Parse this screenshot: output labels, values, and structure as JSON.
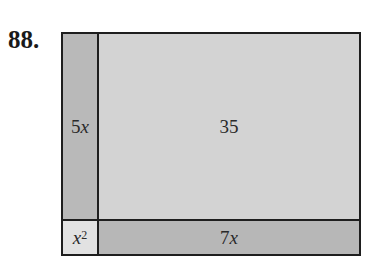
{
  "problem_number": "88.",
  "diagram": {
    "regions": {
      "left_strip": {
        "coef": "5",
        "var": "x"
      },
      "main": {
        "label": "35"
      },
      "corner": {
        "var": "x",
        "exp": "2"
      },
      "bottom_strip": {
        "coef": "7",
        "var": "x"
      }
    },
    "colors": {
      "left_strip": "#b9b9b9",
      "main": "#d3d3d3",
      "corner": "#e2e2e2",
      "bottom_strip": "#b7b7b7",
      "border": "#1e1e1e"
    }
  }
}
